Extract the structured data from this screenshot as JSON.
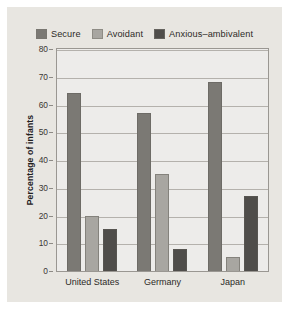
{
  "chart_data": {
    "type": "bar",
    "title": "",
    "xlabel": "",
    "ylabel": "Percentage of infants",
    "ylim": [
      0,
      80
    ],
    "ytick_step": 10,
    "grid": true,
    "legend_position": "top",
    "categories": [
      "United States",
      "Germany",
      "Japan"
    ],
    "ytick_labels": [
      "0",
      "10",
      "20",
      "30",
      "40",
      "50",
      "60",
      "70",
      "80"
    ],
    "series": [
      {
        "name": "Secure",
        "color": "#7b7974",
        "values": [
          64,
          57,
          68
        ]
      },
      {
        "name": "Avoidant",
        "color": "#a8a6a1",
        "values": [
          20,
          35,
          5
        ]
      },
      {
        "name": "Anxious–ambivalent",
        "color": "#4f4d4a",
        "values": [
          15,
          8,
          27
        ]
      }
    ]
  },
  "colors": {
    "figure_background": "#e8e6e1",
    "plot_background": "#edecea",
    "axis": "#9a9792",
    "gridline": "#b4b1ac",
    "text": "#2c2a27"
  }
}
